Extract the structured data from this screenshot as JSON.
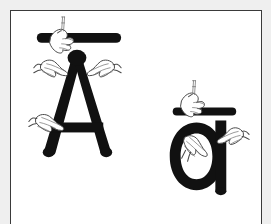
{
  "image": {
    "kind": "scanned-illustration",
    "description": "Black-and-white line illustration of two letterforms being drawn by hands",
    "background_color": "#efefef",
    "plate_color": "#ffffff",
    "ink_color": "#111111",
    "border_color": "#3a3a3a",
    "hand_line_color": "#4a4a4a"
  },
  "plate": {
    "label": "illustration-plate",
    "border_sides": "left, top, right",
    "width_px": 252,
    "height_px": 214
  },
  "glyphs": [
    {
      "id": "uppercase-a-macron",
      "character": "Ā",
      "base_letter": "A",
      "case": "uppercase",
      "diacritic": "macron",
      "position": "left",
      "bbox": {
        "x": 28,
        "y": 22,
        "w": 100,
        "h": 134
      },
      "parts": [
        {
          "name": "macron-bar",
          "shape": "rounded-horizontal-bar"
        },
        {
          "name": "left-diagonal-stroke",
          "shape": "diagonal"
        },
        {
          "name": "right-diagonal-stroke",
          "shape": "diagonal"
        },
        {
          "name": "crossbar",
          "shape": "horizontal"
        }
      ]
    },
    {
      "id": "lowercase-a-macron",
      "character": "ā",
      "base_letter": "a",
      "case": "lowercase",
      "diacritic": "macron",
      "position": "right",
      "bbox": {
        "x": 162,
        "y": 88,
        "w": 70,
        "h": 104
      },
      "parts": [
        {
          "name": "macron-bar",
          "shape": "rounded-horizontal-bar"
        },
        {
          "name": "bowl",
          "shape": "oval"
        },
        {
          "name": "stem",
          "shape": "vertical"
        }
      ]
    }
  ],
  "hands": [
    {
      "id": "hand-on-uppercase-macron",
      "target": "uppercase-a-macron",
      "target_part": "macron-bar",
      "gesture": "holding-stylus",
      "orientation": "left-to-right"
    },
    {
      "id": "hand-left-of-apex",
      "target": "uppercase-a-macron",
      "target_part": "left-diagonal-stroke",
      "gesture": "pinching-stroke",
      "orientation": "pointing-right"
    },
    {
      "id": "hand-right-of-apex",
      "target": "uppercase-a-macron",
      "target_part": "right-diagonal-stroke",
      "gesture": "pinching-stroke",
      "orientation": "pointing-left"
    },
    {
      "id": "hand-on-crossbar",
      "target": "uppercase-a-macron",
      "target_part": "crossbar",
      "gesture": "pinching-stroke",
      "orientation": "pointing-right"
    },
    {
      "id": "hand-on-lowercase-macron",
      "target": "lowercase-a-macron",
      "target_part": "macron-bar",
      "gesture": "holding-stylus",
      "orientation": "left-to-right"
    },
    {
      "id": "hand-in-bowl",
      "target": "lowercase-a-macron",
      "target_part": "bowl",
      "gesture": "pinching-stroke",
      "orientation": "pointing-down-right"
    },
    {
      "id": "hand-on-stem",
      "target": "lowercase-a-macron",
      "target_part": "stem",
      "gesture": "pinching-stroke",
      "orientation": "pointing-left"
    }
  ],
  "text_content": {
    "visible_text": "",
    "note": "No readable typeset text appears in the image; only the two drawn letterforms."
  }
}
